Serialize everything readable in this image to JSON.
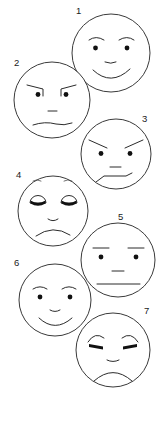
{
  "image": {
    "title": "Seven numbered cartoon face expressions",
    "width": 165,
    "height": 422,
    "background_color": "#ffffff",
    "line_color": "#2b2b2b",
    "style": "black and white line drawing"
  },
  "faces": [
    {
      "number": "1",
      "label_x": 76,
      "label_y": 14,
      "cx": 111,
      "cy": 53,
      "r": 39,
      "expression": "happy",
      "description": "smiling face with raised curved eyebrows, round dot eyes, small nose, wide upturned smile"
    },
    {
      "number": "2",
      "label_x": 14,
      "label_y": 66,
      "cx": 52,
      "cy": 100,
      "r": 38,
      "expression": "angry-suspicious",
      "description": "face with angled hooked eyebrows, dot eyes, small nose, flat slightly wavy mouth"
    },
    {
      "number": "3",
      "label_x": 142,
      "label_y": 122,
      "cx": 116,
      "cy": 154,
      "r": 35,
      "expression": "angry",
      "description": "face with sharp inward slanting eyebrows, dot eyes, small nose, crooked downturned mouth"
    },
    {
      "number": "4",
      "label_x": 16,
      "label_y": 178,
      "cx": 53,
      "cy": 211,
      "r": 35,
      "expression": "sad-sleepy",
      "description": "face with faint small eyebrows, half-closed drooping eyes with filled lower lids, small nose, frowning mouth"
    },
    {
      "number": "5",
      "label_x": 118,
      "label_y": 220,
      "cx": 118,
      "cy": 260,
      "r": 37,
      "expression": "neutral",
      "description": "face with flat straight eyebrows, dot eyes, small nose, straight horizontal mouth"
    },
    {
      "number": "6",
      "label_x": 14,
      "label_y": 266,
      "cx": 55,
      "cy": 300,
      "r": 36,
      "expression": "happy",
      "description": "smiling face with curved eyebrows, dot eyes, small nose, upturned smile"
    },
    {
      "number": "7",
      "label_x": 144,
      "label_y": 314,
      "cx": 113,
      "cy": 350,
      "r": 37,
      "expression": "sad",
      "description": "face with worried inward-raised eyebrows, thick squinting dash eyes, small nose, deep frown"
    }
  ]
}
